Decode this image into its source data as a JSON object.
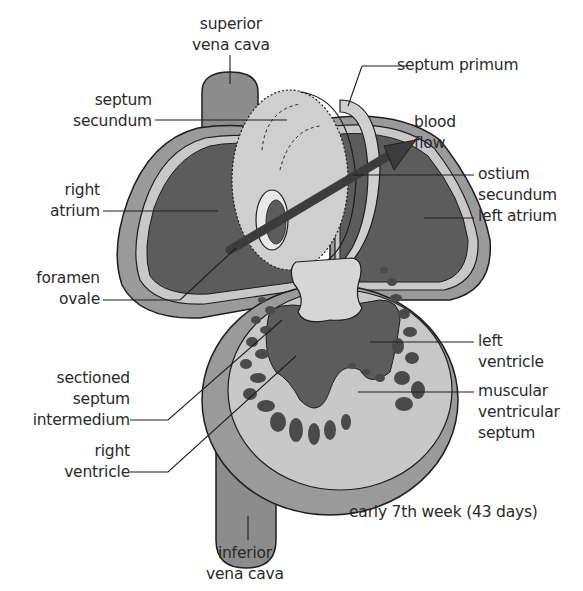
{
  "figure": {
    "caption": "early 7th week (43 days)",
    "colors": {
      "background": "#ffffff",
      "outer_wall": "#9a9a9a",
      "wall_light": "#c8c8c8",
      "chamber_dark": "#5c5c5c",
      "septum_light": "#cfcfcf",
      "cushion": "#d6d6d6",
      "trabeculae": "#4a4a4a",
      "vessel": "#8c8c8c",
      "arrow": "#3c3c3c",
      "outline": "#1e1e1e",
      "text": "#2a2a2a"
    }
  },
  "labels": {
    "superior_vena_cava": [
      "superior",
      "vena cava"
    ],
    "septum_secundum": [
      "septum",
      "secundum"
    ],
    "right_atrium": [
      "right",
      "atrium"
    ],
    "foramen_ovale": [
      "foramen",
      "ovale"
    ],
    "sectioned_septum_intermedium": [
      "sectioned",
      "septum",
      "intermedium"
    ],
    "right_ventricle": [
      "right",
      "ventricle"
    ],
    "inferior_vena_cava": [
      "inferior",
      "vena cava"
    ],
    "septum_primum": [
      "septum primum"
    ],
    "blood_flow": [
      "blood",
      "flow"
    ],
    "ostium_secundum": [
      "ostium",
      "secundum"
    ],
    "left_atrium": [
      "left atrium"
    ],
    "left_ventricle": [
      "left",
      "ventricle"
    ],
    "muscular_ventricular_septum": [
      "muscular",
      "ventricular",
      "septum"
    ]
  }
}
